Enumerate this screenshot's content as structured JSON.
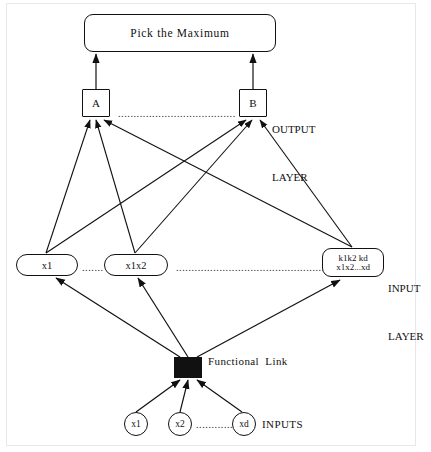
{
  "diagram": {
    "title_box": {
      "label": "Pick  the  Maximum"
    },
    "output_layer": {
      "label": "OUTPUT\nLAYER",
      "label_line1": "OUTPUT",
      "label_line2": "LAYER",
      "nodes": [
        {
          "id": "A",
          "label": "A"
        },
        {
          "id": "B",
          "label": "B"
        }
      ],
      "ellipsis": "......................................"
    },
    "input_layer": {
      "label_line1": "INPUT",
      "label_line2": "LAYER",
      "nodes": [
        {
          "id": "x1",
          "label": "x1"
        },
        {
          "id": "x1x2",
          "label": "x1x2"
        },
        {
          "id": "kd",
          "label_line1": "k1k2  kd",
          "label_line2": "x1x2...xd"
        }
      ],
      "ellipsis_short": ".......",
      "ellipsis_long": "................................................."
    },
    "functional_link": {
      "label": "Functional  Link"
    },
    "inputs": {
      "label": "INPUTS",
      "nodes": [
        {
          "id": "x1",
          "label": "x1"
        },
        {
          "id": "x2",
          "label": "x2"
        },
        {
          "id": "xd",
          "label": "xd"
        }
      ],
      "ellipsis": "................."
    },
    "colors": {
      "stroke": "#111111",
      "fill": "#ffffff",
      "block": "#111111",
      "frame": "#e8e8e8"
    }
  }
}
